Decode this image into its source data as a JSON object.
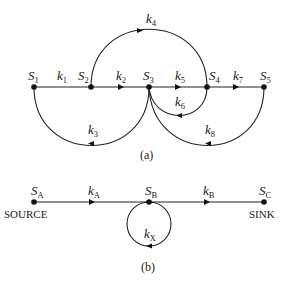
{
  "diagram_a": {
    "caption": "(a)",
    "nodes": [
      {
        "id": "S1",
        "base": "S",
        "sub": "1",
        "x": 34,
        "y": 87
      },
      {
        "id": "S2",
        "base": "S",
        "sub": "2",
        "x": 91,
        "y": 87
      },
      {
        "id": "S3",
        "base": "S",
        "sub": "3",
        "x": 149,
        "y": 87
      },
      {
        "id": "S4",
        "base": "S",
        "sub": "4",
        "x": 207,
        "y": 87
      },
      {
        "id": "S5",
        "base": "S",
        "sub": "5",
        "x": 264,
        "y": 87
      }
    ],
    "edges": [
      {
        "id": "k1",
        "base": "k",
        "sub": "1",
        "from": "S1",
        "to": "S2",
        "shape": "straight"
      },
      {
        "id": "k2",
        "base": "k",
        "sub": "2",
        "from": "S2",
        "to": "S3",
        "shape": "straight"
      },
      {
        "id": "k3",
        "base": "k",
        "sub": "3",
        "from": "S3",
        "to": "S1",
        "shape": "arc-below"
      },
      {
        "id": "k4",
        "base": "k",
        "sub": "4",
        "from": "S2",
        "to": "S4",
        "shape": "arc-above"
      },
      {
        "id": "k5",
        "base": "k",
        "sub": "5",
        "from": "S3",
        "to": "S4",
        "shape": "straight"
      },
      {
        "id": "k6",
        "base": "k",
        "sub": "6",
        "from": "S4",
        "to": "S3",
        "shape": "arc-below"
      },
      {
        "id": "k7",
        "base": "k",
        "sub": "7",
        "from": "S4",
        "to": "S5",
        "shape": "straight"
      },
      {
        "id": "k8",
        "base": "k",
        "sub": "8",
        "from": "S5",
        "to": "S3",
        "shape": "arc-below"
      }
    ]
  },
  "diagram_b": {
    "caption": "(b)",
    "nodes": [
      {
        "id": "SA",
        "base": "S",
        "sub": "A",
        "role": "SOURCE",
        "x": 34,
        "y": 202
      },
      {
        "id": "SB",
        "base": "S",
        "sub": "B",
        "x": 149,
        "y": 202
      },
      {
        "id": "SC",
        "base": "S",
        "sub": "C",
        "role": "SINK",
        "x": 264,
        "y": 202
      }
    ],
    "edges": [
      {
        "id": "kA",
        "base": "k",
        "sub": "A",
        "from": "SA",
        "to": "SB",
        "shape": "straight"
      },
      {
        "id": "kB",
        "base": "k",
        "sub": "B",
        "from": "SB",
        "to": "SC",
        "shape": "straight"
      },
      {
        "id": "kX",
        "base": "k",
        "sub": "X",
        "from": "SB",
        "to": "SB",
        "shape": "self-loop"
      }
    ],
    "source_label": "SOURCE",
    "sink_label": "SINK"
  },
  "colors": {
    "ink": "#111111",
    "background": "#ffffff"
  }
}
